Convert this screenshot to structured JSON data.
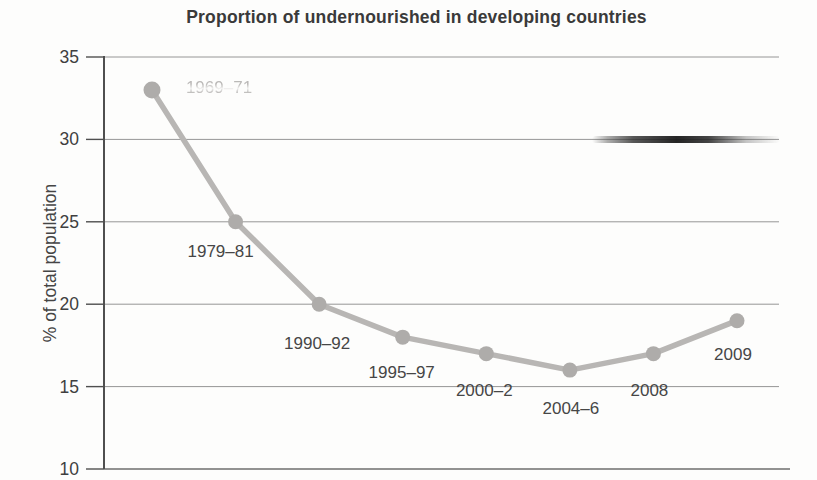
{
  "chart_data": {
    "type": "line",
    "title": "Proportion of undernourished in developing countries",
    "xlabel": "",
    "ylabel": "% of total population",
    "ylim": [
      10,
      35
    ],
    "y_ticks": [
      35,
      30,
      25,
      20,
      15,
      10
    ],
    "grid": true,
    "legend": false,
    "series": [
      {
        "name": "Proportion of undernourished",
        "points": [
          {
            "label": "1969–71",
            "value": 33,
            "faded": true
          },
          {
            "label": "1979–81",
            "value": 25
          },
          {
            "label": "1990–92",
            "value": 20
          },
          {
            "label": "1995–97",
            "value": 18
          },
          {
            "label": "2000–2",
            "value": 17
          },
          {
            "label": "2004–6",
            "value": 16
          },
          {
            "label": "2008",
            "value": 17
          },
          {
            "label": "2009",
            "value": 19
          }
        ]
      }
    ],
    "colors": {
      "line": "#b8b6b4",
      "marker": "#aeacaa",
      "grid": "#969696",
      "axis": "#4f4f4f",
      "x_axis": "#6e6e6e",
      "text": "#464646",
      "title": "#3a3a3a"
    }
  }
}
